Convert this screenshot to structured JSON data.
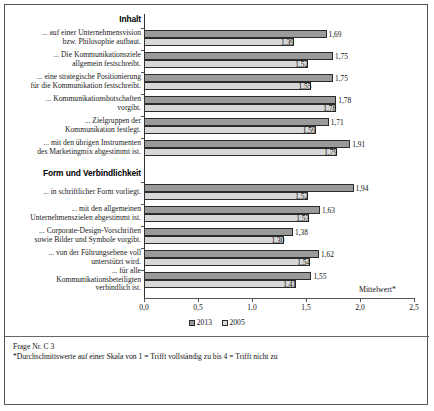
{
  "chart_data": {
    "type": "bar",
    "orientation": "horizontal",
    "title": "",
    "xlabel": "Mittelwert*",
    "ylabel": "",
    "xlim": [
      0.0,
      2.5
    ],
    "xticks": [
      "0,0",
      "0,5",
      "1,0",
      "1,5",
      "2,0",
      "2,5"
    ],
    "xtick_values": [
      0.0,
      0.5,
      1.0,
      1.5,
      2.0,
      2.5
    ],
    "grid": false,
    "legend_position": "bottom",
    "series": [
      {
        "name": "2013",
        "color": "#9a9a9a"
      },
      {
        "name": "2005",
        "color": "#d8d8d8"
      }
    ],
    "sections": [
      {
        "heading": "Inhalt",
        "categories": [
          {
            "label_lines": [
              "... auf einer Unternehmensvision",
              "bzw. Philosophie aufbaut."
            ],
            "v2013": 1.69,
            "v2005": 1.39,
            "t2013": "1,69",
            "t2005": "1,39"
          },
          {
            "label_lines": [
              "... Die Kommunikationsziele",
              "allgemein festschreibt."
            ],
            "v2013": 1.75,
            "v2005": 1.52,
            "t2013": "1,75",
            "t2005": "1,52"
          },
          {
            "label_lines": [
              "... eine strategische Positionierung",
              "für die Kommunikation festschreibt."
            ],
            "v2013": 1.75,
            "v2005": 1.55,
            "t2013": "1,75",
            "t2005": "1,55"
          },
          {
            "label_lines": [
              "... Kommunikationsbotschaften",
              "vorgibt."
            ],
            "v2013": 1.78,
            "v2005": 1.78,
            "t2013": "1,78",
            "t2005": "1,78"
          },
          {
            "label_lines": [
              "... Zielgruppen der",
              "Kommunikation festlegt."
            ],
            "v2013": 1.71,
            "v2005": 1.59,
            "t2013": "1,71",
            "t2005": "1,59"
          },
          {
            "label_lines": [
              "... mit den übrigen Instrumenten",
              "des Marketingmix abgestimmt ist."
            ],
            "v2013": 1.91,
            "v2005": 1.79,
            "t2013": "1,91",
            "t2005": "1,79"
          }
        ]
      },
      {
        "heading": "Form und Verbindlichkeit",
        "categories": [
          {
            "label_lines": [
              "... in schriftlicher Form vorliegt."
            ],
            "v2013": 1.94,
            "v2005": 1.52,
            "t2013": "1,94",
            "t2005": "1,52"
          },
          {
            "label_lines": [
              "... mit den allgemeinen",
              "Unternehmenszielen abgestimmt ist."
            ],
            "v2013": 1.63,
            "v2005": 1.53,
            "t2013": "1,63",
            "t2005": "1,53"
          },
          {
            "label_lines": [
              "... Corporate-Design-Vorschriften",
              "sowie Bilder und Symbole vorgibt."
            ],
            "v2013": 1.38,
            "v2005": 1.3,
            "t2013": "1,38",
            "t2005": "1,30"
          },
          {
            "label_lines": [
              "... von der Führungsebene voll",
              "unterstützt wird."
            ],
            "v2013": 1.62,
            "v2005": 1.54,
            "t2013": "1,62",
            "t2005": "1,54"
          },
          {
            "label_lines": [
              "... für alle",
              "Kommunikationsbeteiligten",
              "verbindlich ist."
            ],
            "v2013": 1.55,
            "v2005": 1.41,
            "t2013": "1,55",
            "t2005": "1,41"
          }
        ]
      }
    ]
  },
  "footnote": {
    "line1": "Frage Nr. C 3",
    "line2": "*Durchschnittswerte auf einer Skala von 1 = Trifft vollständig zu bis 4 = Trifft nicht zu"
  }
}
